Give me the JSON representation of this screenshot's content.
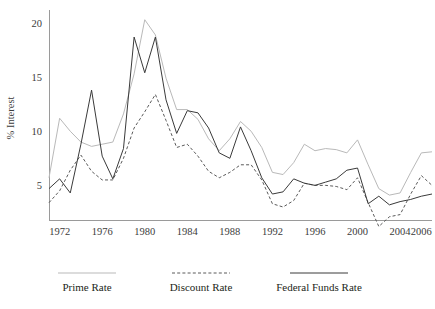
{
  "chart_data": {
    "type": "line",
    "title": "",
    "xlabel": "",
    "ylabel": "% Interest",
    "xlim": [
      1971,
      2007
    ],
    "ylim": [
      1.8,
      21.2
    ],
    "grid": false,
    "legend_position": "bottom",
    "y_ticks": [
      5,
      10,
      15,
      20
    ],
    "y_tick_labels": [
      "5",
      "10",
      "15",
      "20"
    ],
    "x_ticks": [
      1972,
      1976,
      1980,
      1984,
      1988,
      1992,
      1996,
      2000,
      2004,
      2006
    ],
    "x_tick_labels": [
      "1972",
      "1976",
      "1980",
      "1984",
      "1988",
      "1992",
      "1996",
      "2000",
      "2004",
      "2006"
    ],
    "x": [
      1971,
      1972,
      1973,
      1974,
      1975,
      1976,
      1977,
      1978,
      1979,
      1980,
      1981,
      1982,
      1983,
      1984,
      1985,
      1986,
      1987,
      1988,
      1989,
      1990,
      1991,
      1992,
      1993,
      1994,
      1995,
      1996,
      1997,
      1998,
      1999,
      2000,
      2001,
      2002,
      2003,
      2004,
      2005,
      2006,
      2007
    ],
    "series": [
      {
        "name": "Prime Rate",
        "color": "#b9b9b9",
        "style": "solid",
        "values": [
          5.7,
          11.2,
          10.0,
          9.0,
          8.6,
          8.8,
          9.0,
          11.6,
          15.3,
          20.3,
          18.9,
          14.9,
          12.0,
          12.0,
          11.1,
          9.3,
          8.2,
          9.3,
          10.9,
          10.0,
          8.5,
          6.2,
          6.0,
          7.1,
          8.8,
          8.2,
          8.4,
          8.3,
          8.0,
          9.2,
          6.9,
          4.7,
          4.1,
          4.3,
          6.2,
          8.0,
          8.1
        ]
      },
      {
        "name": "Discount Rate",
        "color": "#5a5a5a",
        "style": "dashed",
        "values": [
          3.4,
          4.5,
          6.4,
          7.8,
          6.3,
          5.5,
          5.5,
          7.5,
          10.3,
          11.8,
          13.4,
          11.0,
          8.5,
          8.8,
          7.7,
          6.3,
          5.7,
          6.2,
          6.9,
          6.9,
          5.5,
          3.3,
          3.0,
          3.6,
          5.2,
          5.0,
          5.0,
          4.9,
          4.6,
          5.7,
          3.4,
          1.2,
          2.1,
          2.3,
          4.2,
          5.9,
          5.0
        ]
      },
      {
        "name": "Federal Funds Rate",
        "color": "#3a3a3a",
        "style": "solid",
        "values": [
          4.7,
          5.6,
          4.3,
          8.8,
          13.8,
          7.7,
          5.6,
          8.4,
          18.7,
          15.4,
          18.7,
          12.9,
          9.8,
          11.9,
          11.7,
          10.3,
          8.0,
          7.5,
          10.4,
          8.2,
          5.7,
          4.2,
          4.4,
          5.6,
          5.2,
          5.0,
          5.3,
          5.6,
          6.4,
          6.6,
          3.3,
          4.0,
          3.2,
          3.5,
          3.7,
          4.0,
          4.2
        ]
      }
    ]
  },
  "legend": {
    "items": [
      {
        "label": "Prime Rate"
      },
      {
        "label": "Discount Rate"
      },
      {
        "label": "Federal Funds Rate"
      }
    ]
  },
  "axes": {
    "y_title": "% Interest"
  }
}
